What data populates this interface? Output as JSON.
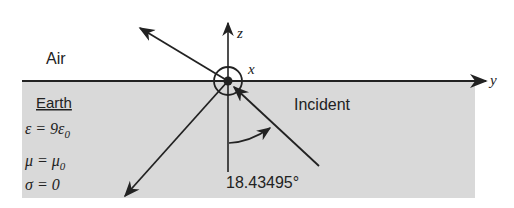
{
  "figure": {
    "colors": {
      "earth_fill": "#d9d9d9",
      "line": "#222222",
      "background": "#ffffff"
    },
    "regions": {
      "upper_label": "Air",
      "lower_label": "Earth"
    },
    "axes": {
      "z_label": "z",
      "y_label": "y",
      "x_label": "x"
    },
    "medium_params": {
      "epsilon": "ε = 9ε",
      "epsilon_sub": "0",
      "mu": "μ = μ",
      "mu_sub": "0",
      "sigma": "σ = 0"
    },
    "rays": {
      "incident_label": "Incident"
    },
    "angle": {
      "value_label": "18.43495°"
    }
  }
}
